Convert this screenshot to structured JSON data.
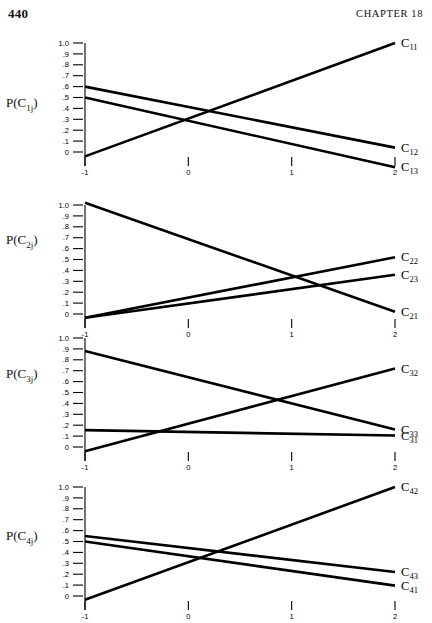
{
  "page": {
    "folio": "440",
    "running_head": "CHAPTER 18"
  },
  "axis": {
    "y_tick_labels": [
      "1.0",
      ".9",
      ".8",
      ".7",
      ".6",
      ".5",
      ".4",
      ".3",
      ".2",
      ".1",
      "0"
    ],
    "y_tick_values": [
      1.0,
      0.9,
      0.8,
      0.7,
      0.6,
      0.5,
      0.4,
      0.3,
      0.2,
      0.1,
      0.0
    ],
    "x_tick_labels": [
      "-1",
      "0",
      "1",
      "2"
    ],
    "x_tick_values": [
      -1,
      0,
      1,
      2
    ],
    "ylim": [
      -0.06,
      1.05
    ],
    "xlim": [
      -1,
      2
    ],
    "grid": false,
    "line_color": "#000000"
  },
  "chart_data": [
    {
      "type": "line",
      "panel_index": 0,
      "ylabel": "P(C1j)",
      "ylabel_base": "P(C",
      "ylabel_sub": "1j",
      "ylabel_close": ")",
      "xlabel": "",
      "title": "",
      "x": [
        -1,
        2
      ],
      "xlim": [
        -1,
        2
      ],
      "ylim": [
        -0.06,
        1.05
      ],
      "series": [
        {
          "name": "C11",
          "label": "C",
          "sub": "11",
          "values": [
            -0.04,
            1.0
          ],
          "end_y": 1.0,
          "label_x": 2.02
        },
        {
          "name": "C12",
          "label": "C",
          "sub": "12",
          "values": [
            0.6,
            0.04
          ],
          "end_y": 0.04,
          "label_x": 2.02
        },
        {
          "name": "C13",
          "label": "C",
          "sub": "13",
          "values": [
            0.5,
            -0.14
          ],
          "end_y": -0.14,
          "label_x": 2.02
        }
      ]
    },
    {
      "type": "line",
      "panel_index": 1,
      "ylabel": "P(C2j)",
      "ylabel_base": "P(C",
      "ylabel_sub": "2j",
      "ylabel_close": ")",
      "xlabel": "",
      "title": "",
      "x": [
        -1,
        2
      ],
      "xlim": [
        -1,
        2
      ],
      "ylim": [
        -0.06,
        1.05
      ],
      "series": [
        {
          "name": "C22",
          "label": "C",
          "sub": "22",
          "values": [
            -0.035,
            0.52
          ],
          "end_y": 0.52,
          "label_x": 2.02
        },
        {
          "name": "C23",
          "label": "C",
          "sub": "23",
          "values": [
            -0.035,
            0.36
          ],
          "end_y": 0.36,
          "label_x": 2.02
        },
        {
          "name": "C21",
          "label": "C",
          "sub": "21",
          "values": [
            1.02,
            0.02
          ],
          "end_y": 0.02,
          "label_x": 2.02
        }
      ]
    },
    {
      "type": "line",
      "panel_index": 2,
      "ylabel": "P(C3j)",
      "ylabel_base": "P(C",
      "ylabel_sub": "3j",
      "ylabel_close": ")",
      "xlabel": "",
      "title": "",
      "x": [
        -1,
        2
      ],
      "xlim": [
        -1,
        2
      ],
      "ylim": [
        -0.06,
        1.05
      ],
      "series": [
        {
          "name": "C32",
          "label": "C",
          "sub": "32",
          "values": [
            -0.04,
            0.72
          ],
          "end_y": 0.72,
          "label_x": 2.02
        },
        {
          "name": "C33",
          "label": "C",
          "sub": "33",
          "values": [
            0.88,
            0.16
          ],
          "end_y": 0.16,
          "label_x": 2.02
        },
        {
          "name": "C31",
          "label": "C",
          "sub": "31",
          "values": [
            0.155,
            0.105
          ],
          "end_y": 0.105,
          "label_x": 2.02
        }
      ]
    },
    {
      "type": "line",
      "panel_index": 3,
      "ylabel": "P(C4j)",
      "ylabel_base": "P(C",
      "ylabel_sub": "4j",
      "ylabel_close": ")",
      "xlabel": "",
      "title": "",
      "x": [
        -1,
        2
      ],
      "xlim": [
        -1,
        2
      ],
      "ylim": [
        -0.06,
        1.05
      ],
      "series": [
        {
          "name": "C42",
          "label": "C",
          "sub": "42",
          "values": [
            -0.035,
            1.0
          ],
          "end_y": 1.0,
          "label_x": 2.02
        },
        {
          "name": "C43",
          "label": "C",
          "sub": "43",
          "values": [
            0.55,
            0.22
          ],
          "end_y": 0.22,
          "label_x": 2.02
        },
        {
          "name": "C41",
          "label": "C",
          "sub": "41",
          "values": [
            0.5,
            0.095
          ],
          "end_y": 0.095,
          "label_x": 2.02
        }
      ]
    }
  ]
}
